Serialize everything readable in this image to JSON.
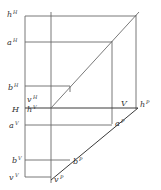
{
  "diagram": {
    "type": "orthographic-projection",
    "colors": {
      "line": "#6a6a6a",
      "text": "#333333",
      "background": "#ffffff"
    },
    "labels": [
      {
        "id": "hH",
        "base": "h",
        "sup": "H",
        "x": 7,
        "y": 17
      },
      {
        "id": "aH",
        "base": "a",
        "sup": "H",
        "x": 7,
        "y": 45
      },
      {
        "id": "bH",
        "base": "b",
        "sup": "H",
        "x": 8,
        "y": 90
      },
      {
        "id": "vH",
        "base": "v",
        "sup": "H",
        "x": 27,
        "y": 102
      },
      {
        "id": "H",
        "base": "H",
        "sup": "",
        "x": 12,
        "y": 112
      },
      {
        "id": "hV",
        "base": "h",
        "sup": "V",
        "x": 27,
        "y": 112
      },
      {
        "id": "aV",
        "base": "a",
        "sup": "V",
        "x": 9,
        "y": 128
      },
      {
        "id": "V",
        "base": "V",
        "sup": "",
        "x": 121,
        "y": 106
      },
      {
        "id": "hP",
        "base": "h",
        "sup": "P",
        "x": 140,
        "y": 107
      },
      {
        "id": "aP",
        "base": "a",
        "sup": "P",
        "x": 115,
        "y": 126
      },
      {
        "id": "bV",
        "base": "b",
        "sup": "V",
        "x": 12,
        "y": 163
      },
      {
        "id": "bP",
        "base": "b",
        "sup": "P",
        "x": 73,
        "y": 164
      },
      {
        "id": "vV",
        "base": "v",
        "sup": "V",
        "x": 9,
        "y": 180
      },
      {
        "id": "vP",
        "base": "v",
        "sup": "P",
        "x": 54,
        "y": 182
      }
    ]
  }
}
